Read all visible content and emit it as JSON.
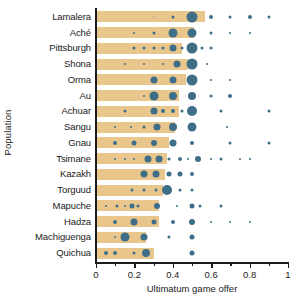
{
  "chart_data": {
    "type": "bar",
    "title": "",
    "xlabel": "Ultimatum game offer",
    "ylabel": "Population",
    "xlim": [
      0,
      1
    ],
    "grid": false,
    "legend": "none",
    "xticks": [
      0,
      0.2,
      0.4,
      0.6,
      0.8,
      1
    ],
    "xticklabels": [
      "0",
      "0.2",
      "0.4",
      "0.6",
      "0.8",
      "1"
    ],
    "xminorticks": [
      0.1,
      0.3,
      0.5,
      0.7,
      0.9
    ],
    "bar_color": "#e9c78c",
    "dot_color": "#3f6f88",
    "axis_color": "#1b1b1b",
    "note": "Horizontal bars show mean offer per population; dots are sized by frequency of each offer value.",
    "categories": [
      "Lamalera",
      "Aché",
      "Pittsburgh",
      "Shona",
      "Orma",
      "Au",
      "Achuar",
      "Sangu",
      "Gnau",
      "Tsimane",
      "Kazakh",
      "Torguud",
      "Mapuche",
      "Hadza",
      "Machiguenga",
      "Quichua"
    ],
    "values": [
      0.57,
      0.51,
      0.45,
      0.45,
      0.44,
      0.43,
      0.42,
      0.41,
      0.38,
      0.37,
      0.36,
      0.35,
      0.33,
      0.33,
      0.26,
      0.25
    ],
    "series": [
      {
        "name": "Lamalera",
        "bar": 0.57,
        "points": [
          {
            "x": 0.3,
            "size": 1
          },
          {
            "x": 0.4,
            "size": 3
          },
          {
            "x": 0.5,
            "size": 11
          },
          {
            "x": 0.6,
            "size": 4
          },
          {
            "x": 0.7,
            "size": 3
          },
          {
            "x": 0.8,
            "size": 4
          },
          {
            "x": 0.9,
            "size": 3
          }
        ]
      },
      {
        "name": "Aché",
        "bar": 0.51,
        "points": [
          {
            "x": 0.2,
            "size": 2
          },
          {
            "x": 0.3,
            "size": 3
          },
          {
            "x": 0.4,
            "size": 9
          },
          {
            "x": 0.5,
            "size": 9
          },
          {
            "x": 0.6,
            "size": 3
          },
          {
            "x": 0.7,
            "size": 2
          },
          {
            "x": 0.8,
            "size": 2
          }
        ]
      },
      {
        "name": "Pittsburgh",
        "bar": 0.45,
        "points": [
          {
            "x": 0.2,
            "size": 3
          },
          {
            "x": 0.25,
            "size": 3
          },
          {
            "x": 0.3,
            "size": 3
          },
          {
            "x": 0.35,
            "size": 3
          },
          {
            "x": 0.4,
            "size": 7
          },
          {
            "x": 0.45,
            "size": 3
          },
          {
            "x": 0.5,
            "size": 11
          },
          {
            "x": 0.55,
            "size": 3
          },
          {
            "x": 0.6,
            "size": 3
          }
        ]
      },
      {
        "name": "Shona",
        "bar": 0.48,
        "points": [
          {
            "x": 0.15,
            "size": 2
          },
          {
            "x": 0.25,
            "size": 2
          },
          {
            "x": 0.35,
            "size": 2
          },
          {
            "x": 0.42,
            "size": 7
          },
          {
            "x": 0.5,
            "size": 11
          },
          {
            "x": 0.58,
            "size": 2
          }
        ]
      },
      {
        "name": "Orma",
        "bar": 0.47,
        "points": [
          {
            "x": 0.3,
            "size": 7
          },
          {
            "x": 0.4,
            "size": 7
          },
          {
            "x": 0.5,
            "size": 11
          },
          {
            "x": 0.6,
            "size": 2
          },
          {
            "x": 0.7,
            "size": 2
          }
        ]
      },
      {
        "name": "Au",
        "bar": 0.43,
        "points": [
          {
            "x": 0.25,
            "size": 2
          },
          {
            "x": 0.3,
            "size": 9
          },
          {
            "x": 0.4,
            "size": 8
          },
          {
            "x": 0.5,
            "size": 8
          },
          {
            "x": 0.6,
            "size": 3
          },
          {
            "x": 0.7,
            "size": 4
          }
        ]
      },
      {
        "name": "Achuar",
        "bar": 0.43,
        "points": [
          {
            "x": 0.15,
            "size": 3
          },
          {
            "x": 0.3,
            "size": 7
          },
          {
            "x": 0.35,
            "size": 4
          },
          {
            "x": 0.4,
            "size": 4
          },
          {
            "x": 0.45,
            "size": 3
          },
          {
            "x": 0.5,
            "size": 10
          },
          {
            "x": 0.65,
            "size": 3
          },
          {
            "x": 0.9,
            "size": 3
          }
        ]
      },
      {
        "name": "Sangu",
        "bar": 0.41,
        "points": [
          {
            "x": 0.1,
            "size": 2
          },
          {
            "x": 0.18,
            "size": 2
          },
          {
            "x": 0.25,
            "size": 3
          },
          {
            "x": 0.32,
            "size": 7
          },
          {
            "x": 0.4,
            "size": 8
          },
          {
            "x": 0.5,
            "size": 9
          },
          {
            "x": 0.68,
            "size": 2
          }
        ]
      },
      {
        "name": "Gnau",
        "bar": 0.38,
        "points": [
          {
            "x": 0.1,
            "size": 4
          },
          {
            "x": 0.2,
            "size": 5
          },
          {
            "x": 0.3,
            "size": 6
          },
          {
            "x": 0.4,
            "size": 7
          },
          {
            "x": 0.5,
            "size": 4
          },
          {
            "x": 0.7,
            "size": 3
          },
          {
            "x": 0.9,
            "size": 3
          }
        ]
      },
      {
        "name": "Tsimane",
        "bar": 0.37,
        "points": [
          {
            "x": 0.1,
            "size": 2
          },
          {
            "x": 0.15,
            "size": 2
          },
          {
            "x": 0.2,
            "size": 2
          },
          {
            "x": 0.27,
            "size": 7
          },
          {
            "x": 0.33,
            "size": 7
          },
          {
            "x": 0.38,
            "size": 3
          },
          {
            "x": 0.44,
            "size": 4
          },
          {
            "x": 0.48,
            "size": 2
          },
          {
            "x": 0.53,
            "size": 6
          },
          {
            "x": 0.6,
            "size": 2
          },
          {
            "x": 0.65,
            "size": 3
          },
          {
            "x": 0.75,
            "size": 2
          },
          {
            "x": 0.8,
            "size": 2
          }
        ]
      },
      {
        "name": "Kazakh",
        "bar": 0.36,
        "points": [
          {
            "x": 0.25,
            "size": 7
          },
          {
            "x": 0.31,
            "size": 7
          },
          {
            "x": 0.38,
            "size": 5
          },
          {
            "x": 0.44,
            "size": 5
          },
          {
            "x": 0.5,
            "size": 4
          }
        ]
      },
      {
        "name": "Torguud",
        "bar": 0.35,
        "points": [
          {
            "x": 0.19,
            "size": 3
          },
          {
            "x": 0.25,
            "size": 3
          },
          {
            "x": 0.31,
            "size": 3
          },
          {
            "x": 0.37,
            "size": 10
          },
          {
            "x": 0.44,
            "size": 3
          },
          {
            "x": 0.5,
            "size": 3
          }
        ]
      },
      {
        "name": "Mapuche",
        "bar": 0.33,
        "points": [
          {
            "x": 0.05,
            "size": 2
          },
          {
            "x": 0.11,
            "size": 3
          },
          {
            "x": 0.15,
            "size": 2
          },
          {
            "x": 0.19,
            "size": 5
          },
          {
            "x": 0.22,
            "size": 3
          },
          {
            "x": 0.32,
            "size": 6
          },
          {
            "x": 0.42,
            "size": 2
          },
          {
            "x": 0.5,
            "size": 5
          },
          {
            "x": 0.54,
            "size": 3
          },
          {
            "x": 0.65,
            "size": 3
          }
        ]
      },
      {
        "name": "Hadza",
        "bar": 0.33,
        "points": [
          {
            "x": 0.1,
            "size": 4
          },
          {
            "x": 0.2,
            "size": 7
          },
          {
            "x": 0.3,
            "size": 5
          },
          {
            "x": 0.4,
            "size": 4
          },
          {
            "x": 0.5,
            "size": 6
          },
          {
            "x": 0.6,
            "size": 2
          },
          {
            "x": 0.7,
            "size": 2
          },
          {
            "x": 0.8,
            "size": 2
          }
        ]
      },
      {
        "name": "Machiguenga",
        "bar": 0.26,
        "points": [
          {
            "x": 0.1,
            "size": 2
          },
          {
            "x": 0.15,
            "size": 9
          },
          {
            "x": 0.25,
            "size": 7
          },
          {
            "x": 0.38,
            "size": 3
          },
          {
            "x": 0.5,
            "size": 5
          }
        ]
      },
      {
        "name": "Quichua",
        "bar": 0.3,
        "points": [
          {
            "x": 0.05,
            "size": 4
          },
          {
            "x": 0.1,
            "size": 4
          },
          {
            "x": 0.2,
            "size": 3
          },
          {
            "x": 0.26,
            "size": 8
          },
          {
            "x": 0.5,
            "size": 5
          }
        ]
      }
    ]
  }
}
